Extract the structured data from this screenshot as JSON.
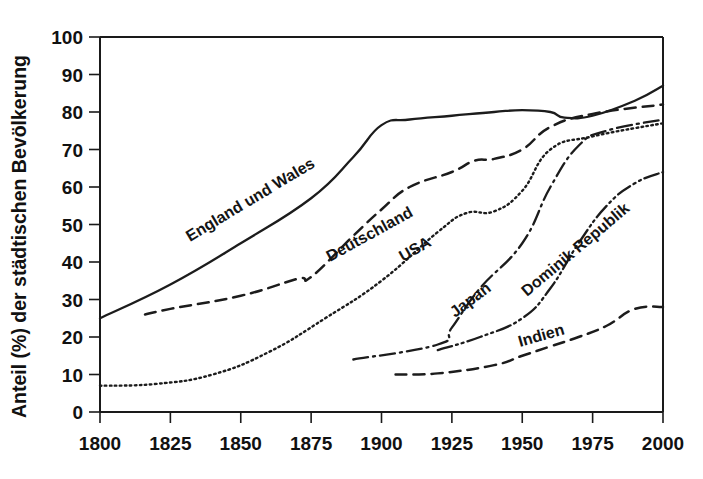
{
  "chart_data": {
    "type": "line",
    "title": "",
    "xlabel": "",
    "ylabel": "Anteil (%) der städtischen Bevölkerung",
    "xlim": [
      1800,
      2000
    ],
    "ylim": [
      0,
      100
    ],
    "grid": false,
    "legend_position": "inline-labels",
    "xticks": [
      "1800",
      "1825",
      "1850",
      "1875",
      "1900",
      "1925",
      "1950",
      "1975",
      "2000"
    ],
    "yticks": [
      "0",
      "10",
      "20",
      "30",
      "40",
      "50",
      "60",
      "70",
      "80",
      "90",
      "100"
    ],
    "series": [
      {
        "name": "England und Wales",
        "style": "solid",
        "label_angle": -31,
        "label_x": 190,
        "label_y": 242,
        "x": [
          1800,
          1825,
          1850,
          1875,
          1890,
          1900,
          1910,
          1925,
          1940,
          1950,
          1960,
          1965,
          1975,
          1990,
          2000
        ],
        "y": [
          25,
          34,
          45,
          57,
          68,
          76.5,
          78,
          79,
          80,
          80.5,
          80,
          78.5,
          79,
          83,
          87
        ]
      },
      {
        "name": "Deutschland",
        "style": "dashed",
        "label_angle": -29,
        "label_x": 330,
        "label_y": 262,
        "x": [
          1816,
          1825,
          1850,
          1870,
          1875,
          1890,
          1900,
          1910,
          1925,
          1933,
          1940,
          1950,
          1960,
          1975,
          2000
        ],
        "y": [
          26,
          27.5,
          31,
          35.5,
          36,
          47,
          54,
          60,
          64,
          67,
          67.5,
          70,
          76,
          79.5,
          82
        ]
      },
      {
        "name": "USA",
        "style": "dotted",
        "label_angle": -30,
        "label_x": 403,
        "label_y": 262,
        "x": [
          1800,
          1820,
          1840,
          1860,
          1880,
          1900,
          1920,
          1930,
          1940,
          1950,
          1960,
          1975,
          2000
        ],
        "y": [
          7,
          7.5,
          10,
          16,
          25,
          35,
          48,
          53,
          53.5,
          59,
          70,
          73.5,
          77
        ]
      },
      {
        "name": "Japan",
        "style": "dashdot",
        "label_angle": -37,
        "label_x": 455,
        "label_y": 318,
        "x": [
          1890,
          1920,
          1925,
          1935,
          1950,
          1960,
          1970,
          1980,
          2000
        ],
        "y": [
          14,
          18,
          22.5,
          33,
          45,
          60,
          71,
          75,
          78
        ]
      },
      {
        "name": "Dominik Republik",
        "style": "dashdotdot",
        "label_angle": -40,
        "label_x": 527,
        "label_y": 297,
        "x": [
          1920,
          1935,
          1950,
          1960,
          1970,
          1980,
          1990,
          2000
        ],
        "y": [
          16.5,
          20,
          25,
          33,
          45,
          55,
          61,
          64
        ]
      },
      {
        "name": "Indien",
        "style": "dashed",
        "label_angle": -16,
        "label_x": 520,
        "label_y": 347,
        "x": [
          1905,
          1920,
          1940,
          1950,
          1960,
          1970,
          1980,
          1990,
          2000
        ],
        "y": [
          10,
          10.3,
          12.5,
          15,
          17.5,
          20,
          23,
          27.5,
          28
        ]
      }
    ]
  },
  "colors": {
    "line": "#1c1c1c",
    "axis": "#1a1a1a",
    "text": "#111111",
    "background": "#ffffff"
  }
}
